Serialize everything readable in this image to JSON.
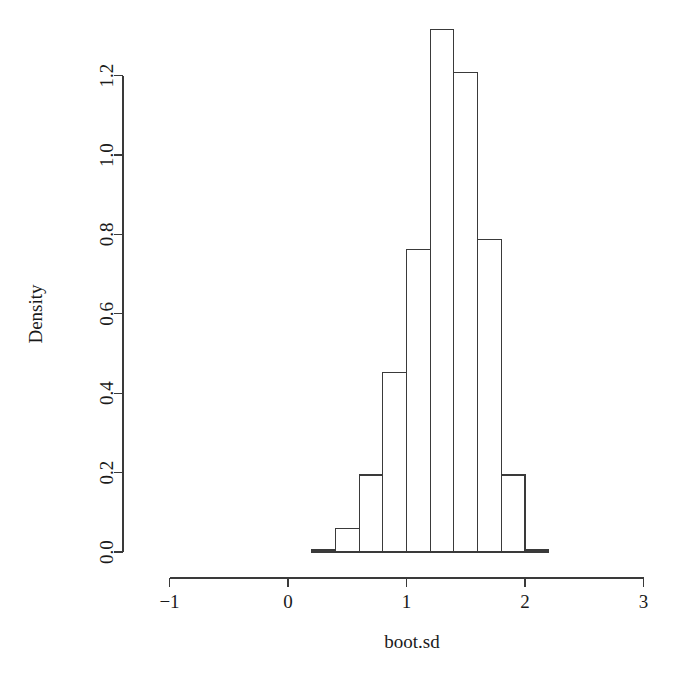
{
  "chart_data": {
    "type": "bar",
    "title": "",
    "subtitle": "",
    "xlabel": "boot.sd",
    "ylabel": "Density",
    "xlim": [
      -1,
      3
    ],
    "ylim": [
      0.0,
      1.2
    ],
    "grid": false,
    "legend": false,
    "bin_width": 0.2,
    "bin_edges": [
      0.2,
      0.4,
      0.6,
      0.8,
      1.0,
      1.2,
      1.4,
      1.6,
      1.8,
      2.0,
      2.2
    ],
    "categories": [
      "0.2-0.4",
      "0.4-0.6",
      "0.6-0.8",
      "0.8-1.0",
      "1.0-1.2",
      "1.2-1.4",
      "1.4-1.6",
      "1.6-1.8",
      "1.8-2.0",
      "2.0-2.2"
    ],
    "values": [
      0.005,
      0.058,
      0.194,
      0.451,
      0.763,
      1.315,
      1.209,
      0.786,
      0.194,
      0.005
    ],
    "x_ticks": [
      {
        "value": -1,
        "label": "−1"
      },
      {
        "value": 0,
        "label": "0"
      },
      {
        "value": 1,
        "label": "1"
      },
      {
        "value": 2,
        "label": "2"
      },
      {
        "value": 3,
        "label": "3"
      }
    ],
    "y_ticks": [
      {
        "value": 0.0,
        "label": "0.0"
      },
      {
        "value": 0.2,
        "label": "0.2"
      },
      {
        "value": 0.4,
        "label": "0.4"
      },
      {
        "value": 0.6,
        "label": "0.6"
      },
      {
        "value": 0.8,
        "label": "0.8"
      },
      {
        "value": 1.0,
        "label": "1.0"
      },
      {
        "value": 1.2,
        "label": "1.2"
      }
    ],
    "bar_fill": "#ffffff",
    "bar_stroke": "#3a3a3a",
    "background": "#ffffff"
  },
  "axes": {
    "x_title": "boot.sd",
    "y_title": "Density"
  }
}
